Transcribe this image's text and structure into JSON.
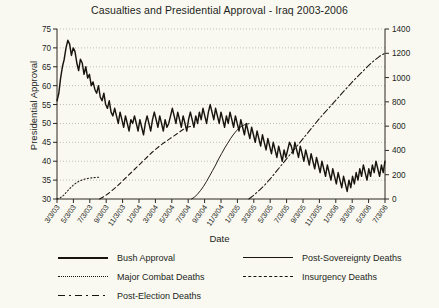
{
  "chart_data": {
    "type": "line",
    "title": "Casualties and Presidential Approval - Iraq 2003-2006",
    "xlabel": "Date",
    "ylabel": "Presidential Approval",
    "y2label": "Combat Deaths",
    "grid": true,
    "legend_position": "bottom",
    "ylim": [
      30,
      75
    ],
    "yticks": [
      30,
      35,
      40,
      45,
      50,
      55,
      60,
      65,
      70,
      75
    ],
    "y2lim": [
      0,
      1400
    ],
    "y2ticks": [
      0,
      200,
      400,
      600,
      800,
      1000,
      1200,
      1400
    ],
    "xticks": [
      "3/3/03",
      "5/3/03",
      "7/3/03",
      "9/3/03",
      "11/3/03",
      "1/3/04",
      "3/3/04",
      "5/3/04",
      "7/3/04",
      "9/3/04",
      "11/3/04",
      "1/3/05",
      "3/3/05",
      "5/3/05",
      "7/3/05",
      "9/3/05",
      "11/3/05",
      "1/3/06",
      "3/3/06",
      "5/3/06",
      "7/3/06"
    ],
    "series": [
      {
        "name": "Bush Approval",
        "axis": "left",
        "style": "solid-thick",
        "values": [
          56,
          58,
          62,
          65,
          67,
          70,
          72,
          71,
          68,
          70,
          69,
          66,
          64,
          67,
          66,
          63,
          65,
          62,
          63,
          60,
          61,
          59,
          58,
          60,
          57,
          56,
          58,
          55,
          54,
          56,
          53,
          52,
          54,
          52,
          50,
          53,
          51,
          49,
          52,
          50,
          48,
          51,
          50,
          52,
          50,
          48,
          51,
          49,
          47,
          50,
          52,
          50,
          48,
          51,
          53,
          51,
          49,
          52,
          50,
          48,
          51,
          49,
          50,
          52,
          54,
          52,
          50,
          53,
          51,
          49,
          52,
          50,
          48,
          51,
          53,
          51,
          49,
          52,
          50,
          53,
          51,
          54,
          52,
          50,
          53,
          55,
          53,
          51,
          54,
          52,
          50,
          53,
          51,
          49,
          52,
          50,
          53,
          51,
          49,
          52,
          50,
          48,
          51,
          49,
          47,
          50,
          48,
          46,
          49,
          47,
          45,
          48,
          46,
          44,
          47,
          45,
          43,
          46,
          44,
          42,
          45,
          43,
          41,
          44,
          42,
          40,
          43,
          41,
          43,
          45,
          44,
          42,
          45,
          43,
          41,
          44,
          42,
          40,
          43,
          41,
          39,
          42,
          40,
          38,
          41,
          39,
          37,
          40,
          38,
          36,
          39,
          37,
          35,
          38,
          36,
          34,
          37,
          35,
          33,
          36,
          34,
          32,
          35,
          33,
          36,
          34,
          37,
          35,
          38,
          36,
          39,
          37,
          35,
          38,
          36,
          39,
          37,
          40,
          38,
          36,
          39,
          37,
          40
        ]
      },
      {
        "name": "Major Combat Deaths",
        "axis": "right",
        "style": "dotted",
        "values": [
          0,
          10,
          30,
          60,
          90,
          115,
          135,
          150,
          160,
          168,
          172,
          175,
          178,
          180
        ]
      },
      {
        "name": "Insurgency Deaths",
        "axis": "right",
        "style": "dashed",
        "values": [
          0,
          20,
          45,
          75,
          105,
          140,
          175,
          210,
          245,
          280,
          315,
          350,
          385,
          415,
          445,
          470,
          495,
          520,
          545,
          570,
          590,
          600
        ]
      },
      {
        "name": "Post-Sovereignty Deaths",
        "axis": "right",
        "style": "solid-thin",
        "values": [
          0,
          15,
          40,
          70,
          105,
          145,
          190,
          235,
          280,
          330,
          375,
          420,
          460,
          500,
          535,
          565,
          590,
          605,
          615,
          620
        ]
      },
      {
        "name": "Post-Election Deaths",
        "axis": "right",
        "style": "dashdot",
        "values": [
          0,
          35,
          75,
          120,
          170,
          225,
          280,
          335,
          390,
          445,
          500,
          555,
          610,
          665,
          715,
          765,
          815,
          865,
          915,
          965,
          1010,
          1055,
          1100,
          1140,
          1175,
          1200
        ]
      }
    ]
  },
  "legend": {
    "items": [
      {
        "label": "Bush Approval",
        "style": "solid-thick",
        "column": 1
      },
      {
        "label": "Major Combat Deaths",
        "style": "dotted",
        "column": 1
      },
      {
        "label": "Post-Election Deaths",
        "style": "dashdot",
        "column": 1
      },
      {
        "label": "Post-Sovereignty Deaths",
        "style": "solid-thin",
        "column": 2
      },
      {
        "label": "Insurgency Deaths",
        "style": "dashed",
        "column": 2
      }
    ]
  }
}
